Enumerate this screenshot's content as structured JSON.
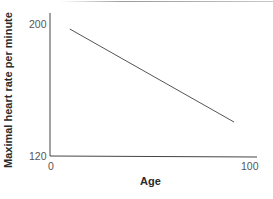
{
  "chart_data": {
    "type": "line",
    "title": "",
    "xlabel": "Age",
    "ylabel": "Maximal heart rate per minute",
    "xlim": [
      0,
      100
    ],
    "ylim": [
      120,
      200
    ],
    "x_ticks": [
      "0",
      "100"
    ],
    "y_ticks": [
      "120",
      "200"
    ],
    "grid": false,
    "legend": null,
    "series": [
      {
        "name": "Maximal heart rate",
        "x": [
          10,
          93
        ],
        "values": [
          197,
          141
        ]
      }
    ]
  },
  "colors": {
    "line": "#555555",
    "axis": "#444444"
  }
}
